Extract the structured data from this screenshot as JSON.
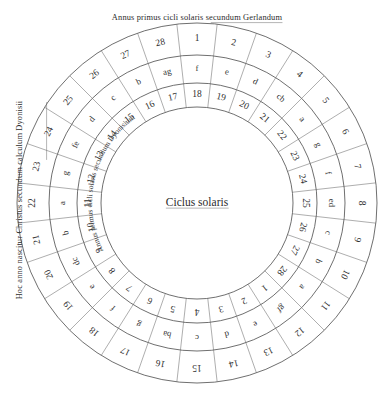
{
  "figure": {
    "center_label": "Ciclus solaris",
    "caption_top": "Annus primus cicli solaris secundum Gerlandum",
    "caption_left": "Hoc anno nascitur Christus secundum calculum Dyonisii",
    "curved_label_inner": "Annus primus cicli solaris secundum Dyonisium",
    "ink_color": "#2b2b2b",
    "line_color": "#4a4a4a",
    "background_color": "#ffffff"
  },
  "rings": {
    "outer": {
      "name": "solar-cycle-years-gerlandus",
      "cells": [
        "1",
        "2",
        "3",
        "4",
        "5",
        "6",
        "7",
        "8",
        "9",
        "10",
        "11",
        "12",
        "13",
        "14",
        "15",
        "16",
        "17",
        "18",
        "19",
        "20",
        "21",
        "22",
        "23",
        "24",
        "25",
        "26",
        "27",
        "28"
      ]
    },
    "middle": {
      "name": "dominical-letters",
      "cells": [
        "f",
        "e",
        "d",
        "cb",
        "a",
        "g",
        "f",
        "ed",
        "c",
        "b",
        "a",
        "gf",
        "e",
        "d",
        "c",
        "ba",
        "g",
        "f",
        "e",
        "dc",
        "b",
        "a",
        "g",
        "fe",
        "d",
        "c",
        "b",
        "ag"
      ]
    },
    "inner": {
      "name": "solar-cycle-years-dyonisius",
      "cells": [
        "18",
        "19",
        "20",
        "21",
        "22",
        "23",
        "24",
        "25",
        "26",
        "27",
        "28",
        "1",
        "2",
        "3",
        "4",
        "5",
        "6",
        "7",
        "8",
        "9",
        "10",
        "11",
        "12",
        "13",
        "14",
        "15",
        "16",
        "17"
      ]
    }
  },
  "geometry": {
    "cx": 197,
    "cy": 203,
    "r_outer": 180,
    "r_mid_outer": 148,
    "r_mid_inner": 120,
    "r_inner": 96,
    "segments": 28
  }
}
